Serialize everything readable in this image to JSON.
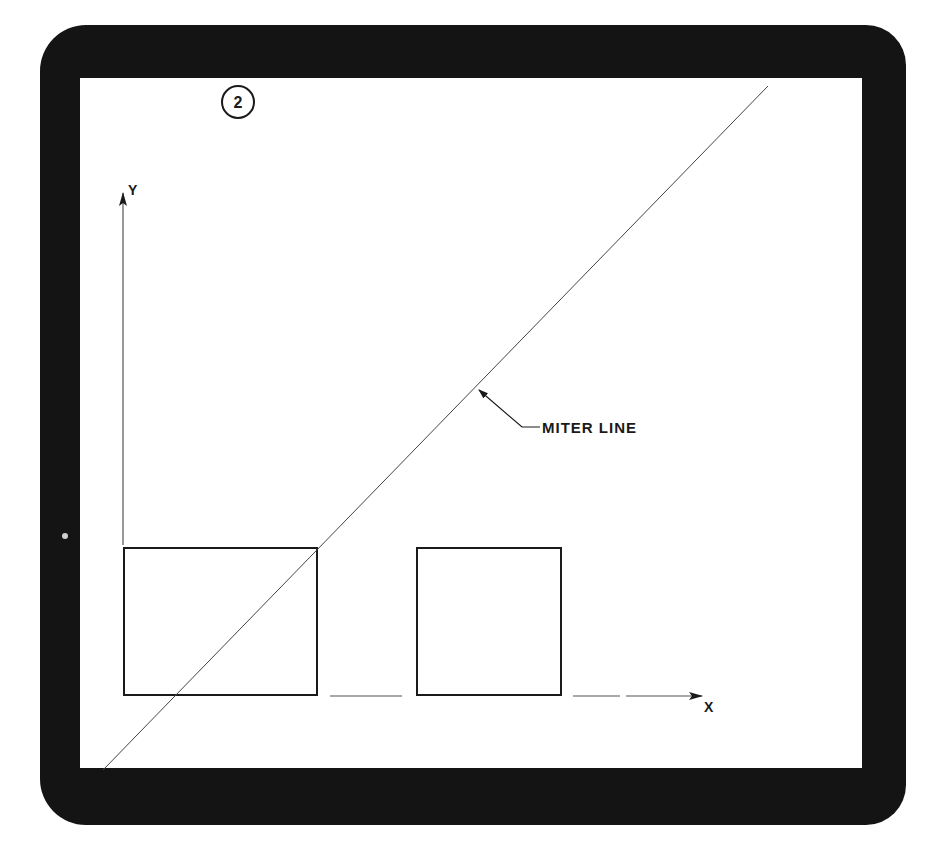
{
  "figure": {
    "step_number": "2",
    "axes": {
      "y_label": "Y",
      "x_label": "X"
    },
    "annotations": {
      "miter_line_label": "MITER LINE"
    },
    "shapes": [
      {
        "name": "front-view-rectangle",
        "x": 124,
        "y": 548,
        "width": 193,
        "height": 147
      },
      {
        "name": "side-view-square",
        "x": 417,
        "y": 548,
        "width": 144,
        "height": 147
      }
    ],
    "colors": {
      "bezel": "#141414",
      "screen": "#ffffff",
      "ink": "#1a1a1a"
    }
  }
}
